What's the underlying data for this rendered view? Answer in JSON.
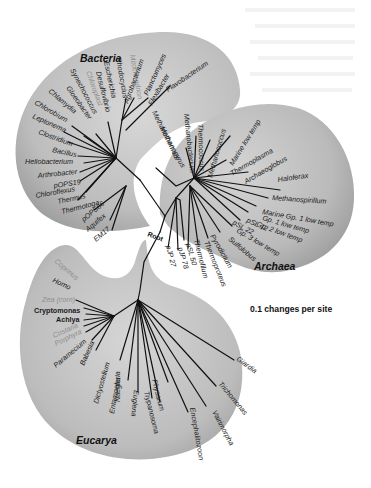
{
  "diagram": {
    "type": "phylogenetic-tree",
    "root_label": "Root",
    "scale_label": "0.1 changes per site",
    "colors": {
      "background": "#ffffff",
      "domain_fill": "#b8b8b8",
      "domain_fill_light": "#d6d6d6",
      "branch": "#111111",
      "label": "#1a1a1a",
      "label_faded": "#8e8e8e"
    },
    "domains": [
      {
        "name": "Bacteria",
        "taxa": [
          {
            "name": "Mitochondrion",
            "faded": true
          },
          {
            "name": "Rhodocyclus",
            "faded": false
          },
          {
            "name": "Escherichia",
            "faded": false
          },
          {
            "name": "Desulfovibrio",
            "faded": false
          },
          {
            "name": "Chloroplast",
            "faded": true
          },
          {
            "name": "Synechococcus",
            "faded": false
          },
          {
            "name": "Gloeobacter",
            "faded": false
          },
          {
            "name": "Chlamydia",
            "faded": false
          },
          {
            "name": "Chlorobium",
            "faded": false
          },
          {
            "name": "Leptonema",
            "faded": false
          },
          {
            "name": "Clostridium",
            "faded": false
          },
          {
            "name": "Bacillus",
            "faded": false
          },
          {
            "name": "Heliobacterium",
            "faded": false
          },
          {
            "name": "Arthrobacter",
            "faded": false
          },
          {
            "name": "pOPS19",
            "faded": false
          },
          {
            "name": "Chloroflexus",
            "faded": false
          },
          {
            "name": "Thermus",
            "faded": false
          },
          {
            "name": "Thermotoga",
            "faded": false
          },
          {
            "name": "pOPS66",
            "faded": false
          },
          {
            "name": "Aquifex",
            "faded": false
          },
          {
            "name": "EM17",
            "faded": false
          },
          {
            "name": "Agrobacterium",
            "faded": false
          },
          {
            "name": "Planctomyces",
            "faded": false
          },
          {
            "name": "Flexibacter",
            "faded": false
          },
          {
            "name": "Flavobacterium",
            "faded": false
          }
        ]
      },
      {
        "name": "Archaea",
        "taxa": [
          {
            "name": "Methanopyrus",
            "faded": false
          },
          {
            "name": "Methanothermus",
            "faded": false
          },
          {
            "name": "Methanobacterium",
            "faded": false
          },
          {
            "name": "Thermococcus",
            "faded": false
          },
          {
            "name": "Methanococcus",
            "faded": false
          },
          {
            "name": "Marine low temp",
            "faded": false
          },
          {
            "name": "Thermoplasma",
            "faded": false
          },
          {
            "name": "Archaeoglobus",
            "faded": false
          },
          {
            "name": "Haloferax",
            "faded": false
          },
          {
            "name": "Methanospirillum",
            "faded": false
          },
          {
            "name": "Marine Gp. 1 low temp",
            "faded": false
          },
          {
            "name": "Gp. 1 low temp",
            "faded": false
          },
          {
            "name": "Gp. 2 low temp",
            "faded": false
          },
          {
            "name": "pSL 12",
            "faded": false
          },
          {
            "name": "pSL 22",
            "faded": false
          },
          {
            "name": "Gp. 3 low temp",
            "faded": false
          },
          {
            "name": "Sulfolobus",
            "faded": false
          },
          {
            "name": "Pyrodictium",
            "faded": false
          },
          {
            "name": "Thermoproteus",
            "faded": false
          },
          {
            "name": "Thermofilum",
            "faded": false
          },
          {
            "name": "pSL 50",
            "faded": false
          },
          {
            "name": "pJP 78",
            "faded": false
          },
          {
            "name": "pJP 27",
            "faded": false
          }
        ]
      },
      {
        "name": "Eucarya",
        "taxa": [
          {
            "name": "Coprinus",
            "faded": true
          },
          {
            "name": "Homo",
            "faded": false
          },
          {
            "name": "Zea (corn)",
            "faded": true
          },
          {
            "name": "Cryptomonas",
            "faded": false
          },
          {
            "name": "Achlya",
            "faded": false
          },
          {
            "name": "Costaria",
            "faded": true
          },
          {
            "name": "Porphyra",
            "faded": true
          },
          {
            "name": "Paramecium",
            "faded": false
          },
          {
            "name": "Babesia",
            "faded": false
          },
          {
            "name": "Dictyostelium",
            "faded": false
          },
          {
            "name": "Entamoeba",
            "faded": false
          },
          {
            "name": "Naegleria",
            "faded": false
          },
          {
            "name": "Euglena",
            "faded": false
          },
          {
            "name": "Trypanosoma",
            "faded": false
          },
          {
            "name": "Physarum",
            "faded": false
          },
          {
            "name": "Encephalitozoon",
            "faded": false
          },
          {
            "name": "Vairimorpha",
            "faded": false
          },
          {
            "name": "Trichomonas",
            "faded": false
          },
          {
            "name": "Giardia",
            "faded": false
          }
        ]
      }
    ]
  }
}
